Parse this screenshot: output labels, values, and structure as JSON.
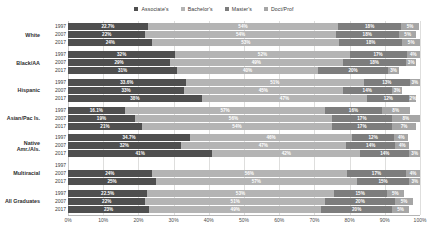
{
  "legend": {
    "position": "top-center",
    "items": [
      {
        "label": "Associate's",
        "color": "#4f4f4f",
        "key": "associates"
      },
      {
        "label": "Bachelor's",
        "color": "#b4b4b4",
        "key": "bachelors"
      },
      {
        "label": "Master's",
        "color": "#7d7d7d",
        "key": "masters"
      },
      {
        "label": "Doct/Prof",
        "color": "#a6a6a6",
        "key": "doctprof"
      }
    ]
  },
  "axis": {
    "xlabel": "",
    "ylabel": "",
    "xlim": [
      0,
      100
    ],
    "ticks": [
      "0%",
      "10%",
      "20%",
      "30%",
      "40%",
      "50%",
      "60%",
      "70%",
      "80%",
      "90%",
      "100%"
    ],
    "tick_values": [
      0,
      10,
      20,
      30,
      40,
      50,
      60,
      70,
      80,
      90,
      100
    ],
    "grid": true
  },
  "chart_data": {
    "type": "bar",
    "title": "",
    "subtitle": "",
    "orientation": "horizontal",
    "stacked": true,
    "normalized": true,
    "xlabel": "",
    "ylabel": "",
    "xlim": [
      0,
      100
    ],
    "grid": true,
    "legend_position": "top-center",
    "series": [
      {
        "name": "Associate's",
        "key": "associates",
        "color": "#4f4f4f"
      },
      {
        "name": "Bachelor's",
        "key": "bachelors",
        "color": "#b4b4b4"
      },
      {
        "name": "Master's",
        "key": "masters",
        "color": "#7d7d7d"
      },
      {
        "name": "Doct/Prof",
        "key": "doctprof",
        "color": "#a6a6a6"
      }
    ],
    "categories": [
      "White",
      "Black/AA",
      "Hispanic",
      "Asian/Pac Is.",
      "Native Amr./Als.",
      "Multiracial",
      "All Graduates"
    ],
    "years": [
      "1997",
      "2007",
      "2017"
    ],
    "groups": [
      {
        "category": "White",
        "rows": [
          {
            "year": "1997",
            "values": [
              22.7,
              54,
              18,
              5
            ],
            "labels": [
              "22.7%",
              "54%",
              "18%",
              "5%"
            ]
          },
          {
            "year": "2007",
            "values": [
              22,
              54,
              18,
              5
            ],
            "labels": [
              "22%",
              "54%",
              "18%",
              "5%"
            ]
          },
          {
            "year": "2017",
            "values": [
              24,
              53,
              18,
              5
            ],
            "labels": [
              "24%",
              "53%",
              "18%",
              "5%"
            ]
          }
        ]
      },
      {
        "category": "Black/AA",
        "rows": [
          {
            "year": "1997",
            "values": [
              32,
              52,
              17,
              4
            ],
            "labels": [
              "32%",
              "52%",
              "17%",
              "4%"
            ]
          },
          {
            "year": "2007",
            "values": [
              29,
              49,
              18,
              3
            ],
            "labels": [
              "29%",
              "49%",
              "18%",
              "3%"
            ]
          },
          {
            "year": "2017",
            "values": [
              31,
              40,
              20,
              3
            ],
            "labels": [
              "31%",
              "40%",
              "20%",
              "3%"
            ]
          }
        ]
      },
      {
        "category": "Hispanic",
        "rows": [
          {
            "year": "1997",
            "values": [
              33.6,
              51,
              13,
              3
            ],
            "labels": [
              "33.6%",
              "51%",
              "13%",
              "3%"
            ]
          },
          {
            "year": "2007",
            "values": [
              33,
              45,
              14,
              3
            ],
            "labels": [
              "33%",
              "45%",
              "14%",
              "3%"
            ]
          },
          {
            "year": "2017",
            "values": [
              38,
              47,
              12,
              2
            ],
            "labels": [
              "38%",
              "47%",
              "12%",
              "2%"
            ]
          }
        ]
      },
      {
        "category": "Asian/Pac Is.",
        "rows": [
          {
            "year": "1997",
            "values": [
              16.1,
              57,
              16,
              8
            ],
            "labels": [
              "16.1%",
              "57%",
              "16%",
              "8%"
            ]
          },
          {
            "year": "2007",
            "values": [
              19,
              56,
              17,
              8
            ],
            "labels": [
              "19%",
              "56%",
              "17%",
              "8%"
            ]
          },
          {
            "year": "2017",
            "values": [
              21,
              54,
              17,
              7
            ],
            "labels": [
              "21%",
              "54%",
              "17%",
              "7%"
            ]
          }
        ]
      },
      {
        "category": "Native Amr./Als.",
        "rows": [
          {
            "year": "1997",
            "values": [
              34.7,
              46,
              12,
              4
            ],
            "labels": [
              "34.7%",
              "46%",
              "12%",
              "4%"
            ]
          },
          {
            "year": "2007",
            "values": [
              32,
              47,
              14,
              4
            ],
            "labels": [
              "32%",
              "47%",
              "14%",
              "4%"
            ]
          },
          {
            "year": "2017",
            "values": [
              41,
              42,
              14,
              3
            ],
            "labels": [
              "41%",
              "42%",
              "14%",
              "3%"
            ]
          }
        ]
      },
      {
        "category": "Multiracial",
        "rows": [
          {
            "year": "1997",
            "values": [
              0,
              0,
              0,
              0
            ],
            "labels": [
              "",
              "",
              "",
              ""
            ]
          },
          {
            "year": "2007",
            "values": [
              24,
              56,
              17,
              4
            ],
            "labels": [
              "24%",
              "56%",
              "17%",
              "4%"
            ]
          },
          {
            "year": "2017",
            "values": [
              25,
              57,
              15,
              3
            ],
            "labels": [
              "25%",
              "57%",
              "15%",
              "3%"
            ]
          }
        ]
      },
      {
        "category": "All Graduates",
        "rows": [
          {
            "year": "1997",
            "values": [
              22.5,
              53,
              15,
              5
            ],
            "labels": [
              "22.5%",
              "53%",
              "15%",
              "5%"
            ]
          },
          {
            "year": "2007",
            "values": [
              22,
              51,
              20,
              5
            ],
            "labels": [
              "22%",
              "51%",
              "20%",
              "5%"
            ]
          },
          {
            "year": "2017",
            "values": [
              23,
              49,
              20,
              5
            ],
            "labels": [
              "23%",
              "49%",
              "20%",
              "5%"
            ]
          }
        ]
      }
    ]
  }
}
